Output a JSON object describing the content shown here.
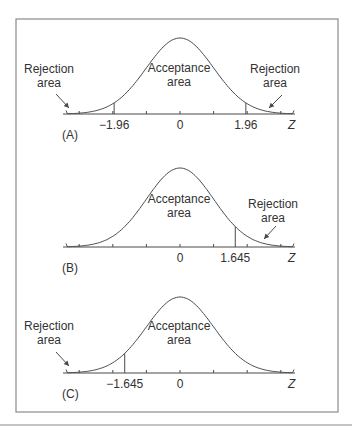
{
  "colors": {
    "line": "#4a4a4a",
    "frame": "#8a8a8a",
    "text": "#333333",
    "background": "#ffffff"
  },
  "frame": {
    "x": 16,
    "y": 19,
    "w": 322,
    "h": 393,
    "bottom_rule_y": 425
  },
  "chart_data": [
    {
      "type": "line",
      "panel": "(A)",
      "title": "Two-tailed test, alpha = 0.05",
      "xlabel": "Z",
      "distribution": "standard normal",
      "xlim": [
        -3.5,
        3.5
      ],
      "tick_positions": [
        -3,
        -2,
        -1,
        0,
        1,
        2,
        3
      ],
      "tick_labels": [
        {
          "x": -1.96,
          "label": "−1.96"
        },
        {
          "x": 0,
          "label": "0"
        },
        {
          "x": 1.96,
          "label": "1.96"
        }
      ],
      "critical_values": [
        -1.96,
        1.96
      ],
      "regions": [
        {
          "label": "Rejection area",
          "range": [
            -3.5,
            -1.96
          ]
        },
        {
          "label": "Acceptance area",
          "range": [
            -1.96,
            1.96
          ]
        },
        {
          "label": "Rejection area",
          "range": [
            1.96,
            3.5
          ]
        }
      ]
    },
    {
      "type": "line",
      "panel": "(B)",
      "title": "Right-tailed test, alpha = 0.05",
      "xlabel": "Z",
      "distribution": "standard normal",
      "xlim": [
        -3.5,
        3.5
      ],
      "tick_positions": [
        -3,
        -2,
        -1,
        0,
        1,
        2,
        3
      ],
      "tick_labels": [
        {
          "x": 0,
          "label": "0"
        },
        {
          "x": 1.645,
          "label": "1.645"
        }
      ],
      "critical_values": [
        1.645
      ],
      "regions": [
        {
          "label": "Acceptance area",
          "range": [
            -3.5,
            1.645
          ]
        },
        {
          "label": "Rejection area",
          "range": [
            1.645,
            3.5
          ]
        }
      ]
    },
    {
      "type": "line",
      "panel": "(C)",
      "title": "Left-tailed test, alpha = 0.05",
      "xlabel": "Z",
      "distribution": "standard normal",
      "xlim": [
        -3.5,
        3.5
      ],
      "tick_positions": [
        -3,
        -2,
        -1,
        0,
        1,
        2,
        3
      ],
      "tick_labels": [
        {
          "x": -1.645,
          "label": "−1.645"
        },
        {
          "x": 0,
          "label": "0"
        }
      ],
      "critical_values": [
        -1.645
      ],
      "regions": [
        {
          "label": "Rejection area",
          "range": [
            -3.5,
            -1.645
          ]
        },
        {
          "label": "Acceptance area",
          "range": [
            -1.645,
            3.5
          ]
        }
      ]
    }
  ],
  "panels": [
    {
      "id": "A",
      "label": "(A)",
      "axis_y": 114,
      "peak_y": 38,
      "zlabel": "Z",
      "acceptance": {
        "line1": "Acceptance",
        "line2": "area",
        "x": 179,
        "y": 72
      },
      "rejections": [
        {
          "line1": "Rejection",
          "line2": "area",
          "x": 49,
          "y": 73,
          "arrow": [
            [
              56,
              94
            ],
            [
              69,
              108
            ]
          ]
        },
        {
          "line1": "Rejection",
          "line2": "area",
          "x": 275,
          "y": 73,
          "arrow": [
            [
              282,
              95
            ],
            [
              269,
              108
            ]
          ]
        }
      ],
      "tick_labels": [
        {
          "z": -1.96,
          "text": "−1.96"
        },
        {
          "z": 0,
          "text": "0"
        },
        {
          "z": 1.96,
          "text": "1.96"
        }
      ],
      "critical": [
        -1.96,
        1.96
      ]
    },
    {
      "id": "B",
      "label": "(B)",
      "axis_y": 247,
      "peak_y": 168,
      "zlabel": "Z",
      "acceptance": {
        "line1": "Acceptance",
        "line2": "area",
        "x": 179,
        "y": 203
      },
      "rejections": [
        {
          "line1": "Rejection",
          "line2": "area",
          "x": 273,
          "y": 208,
          "arrow": [
            [
              276,
              226
            ],
            [
              264,
              239
            ]
          ]
        }
      ],
      "tick_labels": [
        {
          "z": 0,
          "text": "0"
        },
        {
          "z": 1.645,
          "text": "1.645"
        }
      ],
      "critical": [
        1.645
      ]
    },
    {
      "id": "C",
      "label": "(C)",
      "axis_y": 373,
      "peak_y": 297,
      "zlabel": "Z",
      "acceptance": {
        "line1": "Acceptance",
        "line2": "area",
        "x": 179,
        "y": 330
      },
      "rejections": [
        {
          "line1": "Rejection",
          "line2": "area",
          "x": 49,
          "y": 330,
          "arrow": [
            [
              56,
              352
            ],
            [
              69,
              366
            ]
          ]
        }
      ],
      "tick_labels": [
        {
          "z": -1.645,
          "text": "−1.645"
        },
        {
          "z": 0,
          "text": "0"
        }
      ],
      "critical": [
        -1.645
      ]
    }
  ],
  "geometry": {
    "center_x": 180,
    "sigma_px": 33.6,
    "axis_left": 63,
    "axis_right": 295,
    "tail_left": 66,
    "tail_right": 294
  }
}
